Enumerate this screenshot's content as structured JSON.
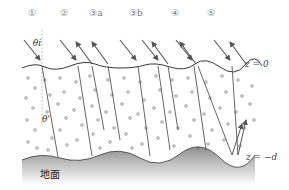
{
  "figure": {
    "type": "radiative-transfer-layer-diagram",
    "path_labels": [
      "①",
      "②",
      "③a",
      "③b",
      "④",
      "⑤"
    ],
    "angle_labels": {
      "incident": "θi",
      "refracted": "θ'"
    },
    "boundaries": {
      "top": "z = 0",
      "bottom": "z = −d"
    },
    "ground_label": "地面",
    "colors": {
      "ray": "#555555",
      "surface_line": "#222222",
      "particle": "#666666",
      "ground_top": "#9a9a9a",
      "ground_bottom": "#ffffff",
      "label": "#777777"
    }
  }
}
